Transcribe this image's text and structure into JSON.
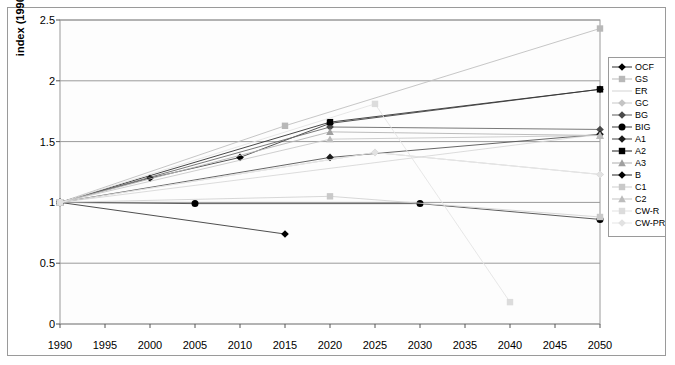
{
  "chart_data": {
    "type": "line",
    "title": "",
    "xlabel": "",
    "ylabel": "index (1990 = 1)",
    "xlim": [
      1990,
      2050
    ],
    "ylim": [
      0,
      2.5
    ],
    "ytick_labels": [
      "0",
      "0.5",
      "1",
      "1.5",
      "2",
      "2.5"
    ],
    "ytick_values": [
      0,
      0.5,
      1,
      1.5,
      2,
      2.5
    ],
    "xtick_labels": [
      "1990",
      "1995",
      "2000",
      "2005",
      "2010",
      "2015",
      "2020",
      "2025",
      "2030",
      "2035",
      "2040",
      "2045",
      "2050"
    ],
    "xtick_values": [
      1990,
      1995,
      2000,
      2005,
      2010,
      2015,
      2020,
      2025,
      2030,
      2035,
      2040,
      2045,
      2050
    ],
    "grid": "horizontal",
    "legend_position": "right-outside",
    "series": [
      {
        "name": "OCF",
        "marker": "diamond",
        "color": "#000000",
        "line_color": "#404040",
        "marker_color": "#000000",
        "x": [
          1990,
          2000,
          2010,
          2020,
          2050
        ],
        "y": [
          1.0,
          1.2,
          1.37,
          1.65,
          1.93
        ]
      },
      {
        "name": "GS",
        "marker": "square",
        "color": "#b5b5b5",
        "line_color": "#c0c0c0",
        "marker_color": "#b8b8b8",
        "x": [
          1990,
          2015,
          2050
        ],
        "y": [
          1.0,
          1.63,
          2.43
        ]
      },
      {
        "name": "ER",
        "marker": "none",
        "color": "#d8d8d8",
        "line_color": "#d8d8d8",
        "marker_color": "#d8d8d8",
        "x": [
          1990,
          2050
        ],
        "y": [
          1.0,
          1.56
        ]
      },
      {
        "name": "GC",
        "marker": "diamond",
        "color": "#c8c8c8",
        "line_color": "#cccccc",
        "marker_color": "#c4c4c4",
        "x": [
          1990,
          2025,
          2050
        ],
        "y": [
          1.0,
          1.41,
          1.23
        ]
      },
      {
        "name": "BG",
        "marker": "diamond",
        "color": "#555555",
        "line_color": "#6a6a6a",
        "marker_color": "#4a4a4a",
        "x": [
          1990,
          2020,
          2050
        ],
        "y": [
          1.0,
          1.62,
          1.6
        ]
      },
      {
        "name": "BIG",
        "marker": "circle",
        "color": "#111111",
        "line_color": "#4a4a4a",
        "marker_color": "#000000",
        "x": [
          1990,
          2005,
          2030,
          2050
        ],
        "y": [
          1.0,
          0.99,
          0.99,
          0.86
        ]
      },
      {
        "name": "A1",
        "marker": "diamond",
        "color": "#333333",
        "line_color": "#555555",
        "marker_color": "#1a1a1a",
        "x": [
          1990,
          2020,
          2050
        ],
        "y": [
          1.0,
          1.37,
          1.56
        ]
      },
      {
        "name": "A2",
        "marker": "square",
        "color": "#000000",
        "line_color": "#333333",
        "marker_color": "#000000",
        "x": [
          1990,
          2020,
          2050
        ],
        "y": [
          1.0,
          1.66,
          1.93
        ]
      },
      {
        "name": "A3",
        "marker": "triangle",
        "color": "#a8a8a8",
        "line_color": "#b4b4b4",
        "marker_color": "#a0a0a0",
        "x": [
          1990,
          2020,
          2050
        ],
        "y": [
          1.0,
          1.58,
          1.55
        ]
      },
      {
        "name": "B",
        "marker": "diamond",
        "color": "#000000",
        "line_color": "#3a3a3a",
        "marker_color": "#000000",
        "x": [
          1990,
          2015
        ],
        "y": [
          1.0,
          0.74
        ]
      },
      {
        "name": "C1",
        "marker": "square",
        "color": "#cfcfcf",
        "line_color": "#d2d2d2",
        "marker_color": "#c9c9c9",
        "x": [
          1990,
          2020,
          2050
        ],
        "y": [
          1.0,
          1.05,
          0.88
        ]
      },
      {
        "name": "C2",
        "marker": "triangle",
        "color": "#c2c2c2",
        "line_color": "#c8c8c8",
        "marker_color": "#bcbcbc",
        "x": [
          1990,
          2020,
          2050
        ],
        "y": [
          1.0,
          1.52,
          1.55
        ]
      },
      {
        "name": "CW-R",
        "marker": "square",
        "color": "#e0e0e0",
        "line_color": "#e4e4e4",
        "marker_color": "#dcdcdc",
        "x": [
          1990,
          2025,
          2040
        ],
        "y": [
          1.0,
          1.81,
          0.18
        ]
      },
      {
        "name": "CW-PR",
        "marker": "diamond",
        "color": "#e6e6e6",
        "line_color": "#e8e8e8",
        "marker_color": "#e2e2e2",
        "x": [
          1990,
          2025,
          2050
        ],
        "y": [
          1.0,
          1.41,
          1.23
        ]
      }
    ]
  },
  "legend": {
    "entries": [
      {
        "label": "OCF"
      },
      {
        "label": "GS"
      },
      {
        "label": "ER"
      },
      {
        "label": "GC"
      },
      {
        "label": "BG"
      },
      {
        "label": "BIG"
      },
      {
        "label": "A1"
      },
      {
        "label": "A2"
      },
      {
        "label": "A3"
      },
      {
        "label": "B"
      },
      {
        "label": "C1"
      },
      {
        "label": "C2"
      },
      {
        "label": "CW-R"
      },
      {
        "label": "CW-PR"
      }
    ]
  },
  "axes": {
    "y_title": "index (1990 = 1)"
  }
}
